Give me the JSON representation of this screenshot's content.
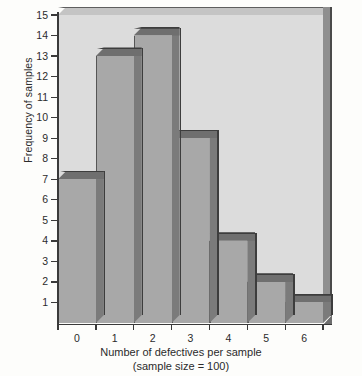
{
  "chart_data": {
    "type": "bar",
    "title": "",
    "subtitle": "",
    "categories": [
      "0",
      "1",
      "2",
      "3",
      "4",
      "5",
      "6"
    ],
    "values": [
      7,
      13,
      14,
      9,
      4,
      2,
      1
    ],
    "xlabel": "Number of defectives per sample",
    "xsublabel": "(sample size = 100)",
    "ylabel": "Frequency of samples",
    "ylim": [
      0,
      15
    ],
    "ytick_labels": [
      "15",
      "14",
      "13",
      "12",
      "11",
      "10",
      "9",
      "8",
      "7",
      "6",
      "5",
      "4",
      "3",
      "2",
      "1"
    ],
    "ytick_values": [
      15,
      14,
      13,
      12,
      11,
      10,
      9,
      8,
      7,
      6,
      5,
      4,
      3,
      2,
      1
    ],
    "grid": false,
    "legend": null,
    "style": "3d-histogram",
    "colors": {
      "panel": "#dcdcdc",
      "bar_face": "#a8a8a8",
      "bar_top": "#6f6f6f",
      "bar_side": "#7b7b7b",
      "outline": "#3d3d3d",
      "axis": "#3a3a3a",
      "text": "#2b2b2b",
      "page": "#fdfdfb"
    }
  }
}
